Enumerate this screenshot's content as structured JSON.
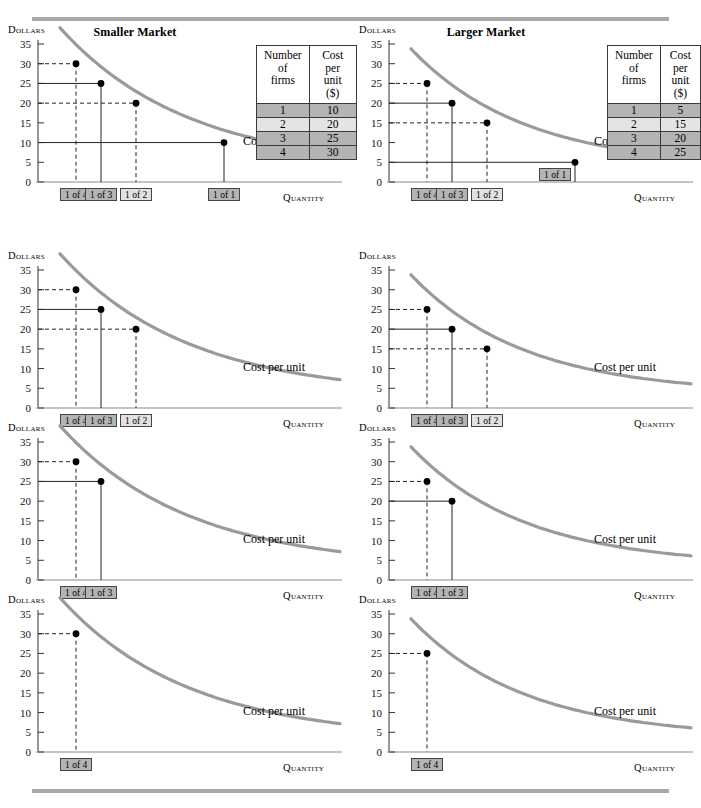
{
  "figure": {
    "title_left": "Smaller Market",
    "title_right": "Larger Market",
    "rule_color": "#a8a8a8",
    "curve_color": "#9a9a9a",
    "box_fill": "#b4b4b4",
    "box_fill_light": "#e2e2e2"
  },
  "axes": {
    "y_label": "Dollars",
    "x_label": "Quantity",
    "curve_label": "Cost per unit",
    "y_ticks": [
      "35",
      "30",
      "25",
      "20",
      "15",
      "10",
      "5",
      "0"
    ],
    "y_min": 0,
    "y_max": 35
  },
  "tables": {
    "left": {
      "header_firms": "Number of firms",
      "header_cost": "Cost per unit ($)",
      "header_firms_lines": [
        "Number",
        "of",
        "firms"
      ],
      "header_cost_lines": [
        "Cost",
        "per",
        "unit",
        "($)"
      ],
      "rows": [
        {
          "firms": "1",
          "cost": "10"
        },
        {
          "firms": "2",
          "cost": "20"
        },
        {
          "firms": "3",
          "cost": "25"
        },
        {
          "firms": "4",
          "cost": "30"
        }
      ]
    },
    "right": {
      "header_firms": "Number of firms",
      "header_cost": "Cost per unit ($)",
      "header_firms_lines": [
        "Number",
        "of",
        "firms"
      ],
      "header_cost_lines": [
        "Cost",
        "per",
        "unit",
        "($)"
      ],
      "rows": [
        {
          "firms": "1",
          "cost": "5"
        },
        {
          "firms": "2",
          "cost": "15"
        },
        {
          "firms": "3",
          "cost": "20"
        },
        {
          "firms": "4",
          "cost": "25"
        }
      ]
    }
  },
  "labels": {
    "one_of_1": "1 of 1",
    "one_of_2": "1 of 2",
    "one_of_3": "1 of 3",
    "one_of_4": "1 of 4"
  },
  "chart_data": {
    "type": "line",
    "xlabel": "Quantity",
    "ylabel": "Dollars",
    "ylim": [
      0,
      35
    ],
    "grid": false,
    "legend": "Cost per unit",
    "panels": [
      {
        "panel": "row1-left",
        "market": "Smaller Market",
        "points": [
          {
            "label": "1 of 4",
            "firms": 4,
            "cost": 30
          },
          {
            "label": "1 of 3",
            "firms": 3,
            "cost": 25
          },
          {
            "label": "1 of 2",
            "firms": 2,
            "cost": 20
          },
          {
            "label": "1 of 1",
            "firms": 1,
            "cost": 10
          }
        ]
      },
      {
        "panel": "row1-right",
        "market": "Larger Market",
        "points": [
          {
            "label": "1 of 4",
            "firms": 4,
            "cost": 25
          },
          {
            "label": "1 of 3",
            "firms": 3,
            "cost": 20
          },
          {
            "label": "1 of 2",
            "firms": 2,
            "cost": 15
          },
          {
            "label": "1 of 1",
            "firms": 1,
            "cost": 5
          }
        ]
      },
      {
        "panel": "row2-left",
        "market": "Smaller Market",
        "points": [
          {
            "label": "1 of 4",
            "firms": 4,
            "cost": 30
          },
          {
            "label": "1 of 3",
            "firms": 3,
            "cost": 25
          },
          {
            "label": "1 of 2",
            "firms": 2,
            "cost": 20
          }
        ]
      },
      {
        "panel": "row2-right",
        "market": "Larger Market",
        "points": [
          {
            "label": "1 of 4",
            "firms": 4,
            "cost": 25
          },
          {
            "label": "1 of 3",
            "firms": 3,
            "cost": 20
          },
          {
            "label": "1 of 2",
            "firms": 2,
            "cost": 15
          }
        ]
      },
      {
        "panel": "row3-left",
        "market": "Smaller Market",
        "points": [
          {
            "label": "1 of 4",
            "firms": 4,
            "cost": 30
          },
          {
            "label": "1 of 3",
            "firms": 3,
            "cost": 25
          }
        ]
      },
      {
        "panel": "row3-right",
        "market": "Larger Market",
        "points": [
          {
            "label": "1 of 4",
            "firms": 4,
            "cost": 25
          },
          {
            "label": "1 of 3",
            "firms": 3,
            "cost": 20
          }
        ]
      },
      {
        "panel": "row4-left",
        "market": "Smaller Market",
        "points": [
          {
            "label": "1 of 4",
            "firms": 4,
            "cost": 30
          }
        ]
      },
      {
        "panel": "row4-right",
        "market": "Larger Market",
        "points": [
          {
            "label": "1 of 4",
            "firms": 4,
            "cost": 25
          }
        ]
      }
    ]
  }
}
